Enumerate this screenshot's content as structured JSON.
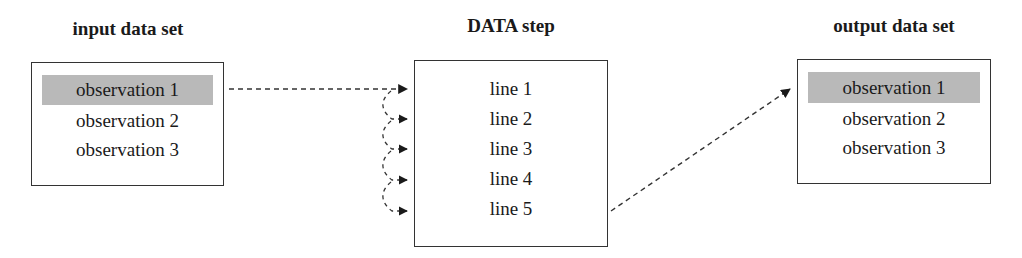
{
  "input": {
    "title": "input data set",
    "rows": [
      "observation 1",
      "observation 2",
      "observation 3"
    ],
    "highlighted_index": 0
  },
  "step": {
    "title": "DATA step",
    "lines": [
      "line 1",
      "line 2",
      "line 3",
      "line 4",
      "line 5"
    ]
  },
  "output": {
    "title": "output data set",
    "rows": [
      "observation 1",
      "observation 2",
      "observation 3"
    ],
    "highlighted_index": 0
  },
  "colors": {
    "highlight": "#b9b9b9",
    "border": "#333333",
    "arrow": "#1a1a1a"
  }
}
